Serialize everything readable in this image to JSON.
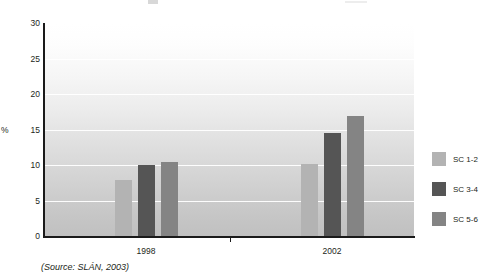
{
  "chart_data": {
    "type": "bar",
    "title": "",
    "subtitle": "",
    "xlabel": "",
    "ylabel": "%",
    "categories": [
      "1998",
      "2002"
    ],
    "series": [
      {
        "name": "SC 1-2",
        "color": "#b3b3b3",
        "values": [
          8.0,
          10.3
        ]
      },
      {
        "name": "SC 3-4",
        "color": "#555555",
        "values": [
          10.2,
          14.7
        ]
      },
      {
        "name": "SC 5-6",
        "color": "#848484",
        "values": [
          10.6,
          17.0
        ]
      }
    ],
    "ylim": [
      0,
      30
    ],
    "yticks": [
      0,
      5,
      10,
      15,
      20,
      25,
      30
    ],
    "ytick_labels": [
      "0",
      "5",
      "10",
      "15",
      "20",
      "25",
      "30"
    ],
    "grid": true,
    "grid_axis": "y",
    "legend_position": "right",
    "annotations": [
      "(Source: SLÁN, 2003)"
    ]
  },
  "axis": {
    "y_title": "%",
    "y_tick_labels": [
      "30",
      "25",
      "20",
      "15",
      "10",
      "5",
      "0"
    ],
    "x_tick_labels": [
      "1998",
      "2002"
    ]
  },
  "legend": {
    "items": [
      {
        "label": "SC 1-2",
        "color": "#b3b3b3"
      },
      {
        "label": "SC 3-4",
        "color": "#555555"
      },
      {
        "label": "SC 5-6",
        "color": "#848484"
      }
    ]
  },
  "footer": {
    "source": "(Source: SLÁN, 2003)"
  }
}
